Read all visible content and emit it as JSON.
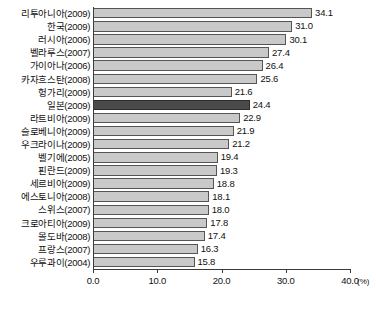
{
  "chart_data": {
    "type": "bar",
    "orientation": "horizontal",
    "title": "",
    "xlabel": "(%)",
    "ylabel": "",
    "xlim": [
      0.0,
      40.0
    ],
    "xticks": [
      "0.0",
      "10.0",
      "20.0",
      "30.0",
      "40.0"
    ],
    "xtick_values": [
      0.0,
      10.0,
      20.0,
      30.0,
      40.0
    ],
    "grid": false,
    "legend": null,
    "unit": "(%)",
    "highlight_category": "일본(2009)",
    "colors": {
      "bar": "#c9c9c9",
      "bar_border": "#555555",
      "highlight_bar": "#4a4a4a",
      "highlight_border": "#2e2e2e",
      "axis": "#3b3b3b",
      "text": "#111111",
      "background": "#ffffff"
    },
    "categories": [
      "리투아니아(2009)",
      "한국(2009)",
      "러시아(2006)",
      "벨라루스(2007)",
      "가이아나(2006)",
      "카자흐스탄(2008)",
      "헝가리(2009)",
      "일본(2009)",
      "라트비아(2009)",
      "슬로베니아(2009)",
      "우크라이나(2009)",
      "벨기에(2005)",
      "핀란드(2009)",
      "세르비아(2009)",
      "에스토니아(2008)",
      "스위스(2007)",
      "크로아티아(2009)",
      "몰도바(2008)",
      "프랑스(2007)",
      "우루과이(2004)"
    ],
    "values": [
      34.1,
      31.0,
      30.1,
      27.4,
      26.4,
      25.6,
      21.6,
      24.4,
      22.9,
      21.9,
      21.2,
      19.4,
      19.3,
      18.8,
      18.1,
      18.0,
      17.8,
      17.4,
      16.3,
      15.8
    ],
    "value_labels": [
      "34.1",
      "31.0",
      "30.1",
      "27.4",
      "26.4",
      "25.6",
      "21.6",
      "24.4",
      "22.9",
      "21.9",
      "21.2",
      "19.4",
      "19.3",
      "18.8",
      "18.1",
      "18.0",
      "17.8",
      "17.4",
      "16.3",
      "15.8"
    ],
    "bar_lengths": [
      34.1,
      31.0,
      30.1,
      27.4,
      26.4,
      25.6,
      21.6,
      24.4,
      22.9,
      21.9,
      21.2,
      19.4,
      19.3,
      18.8,
      18.1,
      18.0,
      17.8,
      17.4,
      16.3,
      15.8
    ]
  }
}
